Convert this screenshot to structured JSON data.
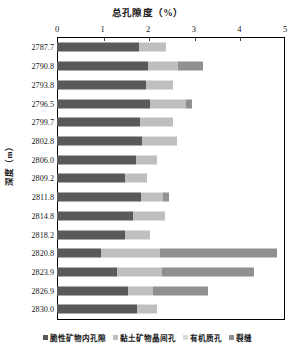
{
  "chart_data": {
    "type": "bar",
    "orientation": "horizontal",
    "stacked": true,
    "title": "总孔隙度（%）",
    "xlabel": "总孔隙度（%）",
    "ylabel": "深度（m）",
    "xlim": [
      0,
      5
    ],
    "xticks": [
      0,
      1,
      2,
      3,
      4,
      5
    ],
    "xtick_labels": [
      "0",
      "1",
      "2",
      "3",
      "4",
      "5"
    ],
    "grid": false,
    "legend_position": "bottom",
    "categories": [
      "2787.7",
      "2790.8",
      "2793.8",
      "2796.5",
      "2799.7",
      "2802.8",
      "2806.0",
      "2809.2",
      "2811.8",
      "2814.8",
      "2818.2",
      "2820.8",
      "2823.9",
      "2826.9",
      "2830.0"
    ],
    "series": [
      {
        "name": "脆性矿物内孔隙",
        "color": "#595959",
        "values": [
          1.79,
          2.0,
          1.96,
          2.05,
          1.81,
          1.87,
          1.74,
          1.5,
          1.85,
          1.67,
          1.5,
          0.97,
          1.32,
          1.56,
          1.76
        ]
      },
      {
        "name": "黏土矿物晶间孔",
        "color": "#bfbfbf",
        "values": [
          0.6,
          0.66,
          0.59,
          0.77,
          0.73,
          0.77,
          0.46,
          0.48,
          0.48,
          0.7,
          0.55,
          1.3,
          0.99,
          0.55,
          0.44
        ]
      },
      {
        "name": "有机质孔",
        "color": "#d9d9d9",
        "values": [
          0.0,
          0.0,
          0.0,
          0.0,
          0.0,
          0.0,
          0.0,
          0.0,
          0.0,
          0.0,
          0.0,
          0.0,
          0.0,
          0.0,
          0.0
        ]
      },
      {
        "name": "裂缝",
        "color": "#909090",
        "values": [
          0.0,
          0.55,
          0.0,
          0.15,
          0.0,
          0.0,
          0.0,
          0.0,
          0.13,
          0.0,
          0.0,
          2.55,
          2.0,
          1.21,
          0.0
        ]
      }
    ],
    "totals": [
      2.39,
      3.21,
      2.55,
      2.97,
      2.54,
      2.64,
      2.2,
      1.98,
      2.46,
      2.37,
      2.05,
      4.82,
      4.31,
      3.32,
      2.2
    ]
  }
}
